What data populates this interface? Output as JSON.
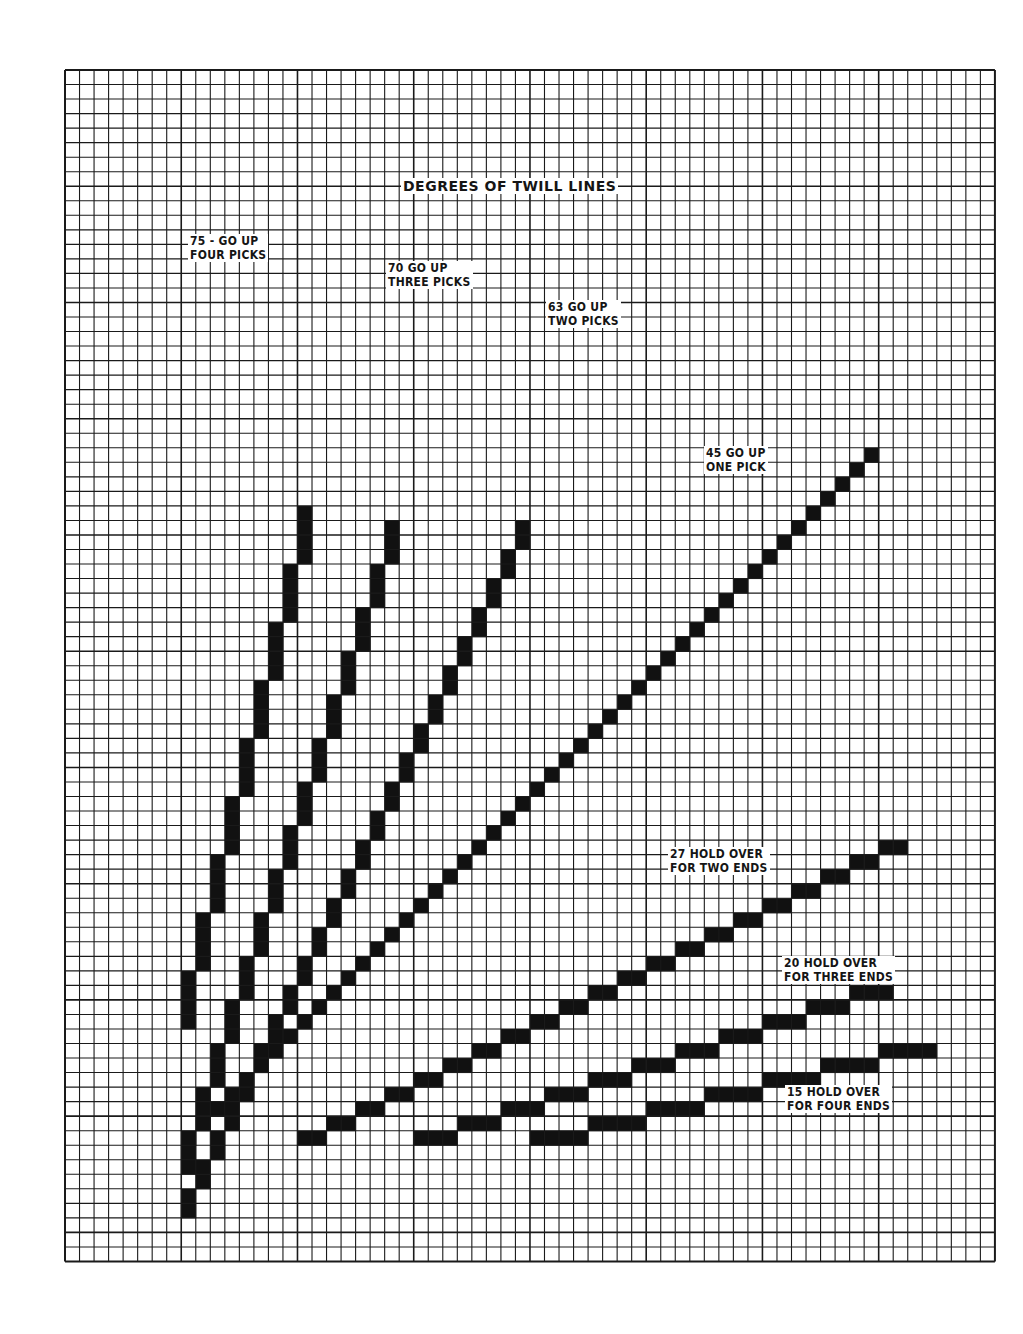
{
  "title": "DEGREES OF TWILL LINES",
  "grid": {
    "left": 65,
    "top": 70,
    "cell": 14.53,
    "cols": 64,
    "rows": 82,
    "line_color": "#1a1a1a",
    "fill_color": "#111111",
    "paper_color": "#ffffff"
  },
  "lines": [
    {
      "id": "75",
      "degrees": "75°",
      "label_line1": "75 - GO UP",
      "label_line2": "FOUR PICKS",
      "rule": "go up four picks",
      "start_col": 8,
      "start_row": 65,
      "step_cols": 1,
      "step_rows": -4,
      "steps": 9,
      "thickness": 1,
      "label_x": 188,
      "label_y": 234
    },
    {
      "id": "70",
      "degrees": "70°",
      "label_line1": "70 GO UP",
      "label_line2": "THREE PICKS",
      "rule": "go up three picks",
      "start_col": 8,
      "start_row": 75,
      "step_cols": 1,
      "step_rows": -3,
      "steps": 15,
      "thickness": 1,
      "label_x": 386,
      "label_y": 261
    },
    {
      "id": "63",
      "degrees": "63°",
      "label_line1": "63 GO UP",
      "label_line2": "TWO PICKS",
      "rule": "go up two picks",
      "start_col": 8,
      "start_row": 78,
      "step_cols": 1,
      "step_rows": -2,
      "steps": 24,
      "thickness": 1,
      "label_x": 546,
      "label_y": 300
    },
    {
      "id": "45",
      "degrees": "45°",
      "label_line1": "45 GO UP",
      "label_line2": "ONE PICK",
      "rule": "go up one pick",
      "start_col": 8,
      "start_row": 73,
      "step_cols": 1,
      "step_rows": -1,
      "steps": 48,
      "thickness": 1,
      "label_x": 704,
      "label_y": 446
    },
    {
      "id": "27",
      "degrees": "27°",
      "label_line1": "27 HOLD OVER",
      "label_line2": "FOR TWO ENDS",
      "rule": "hold over for two ends",
      "start_col": 16,
      "start_row": 73,
      "step_cols": 2,
      "step_rows": -1,
      "steps": 21,
      "thickness": 1,
      "label_x": 668,
      "label_y": 847
    },
    {
      "id": "20",
      "degrees": "20°",
      "label_line1": "20 HOLD OVER",
      "label_line2": "FOR THREE ENDS",
      "rule": "hold over for three ends",
      "start_col": 24,
      "start_row": 73,
      "step_cols": 3,
      "step_rows": -1,
      "steps": 11,
      "thickness": 1,
      "label_x": 782,
      "label_y": 956
    },
    {
      "id": "15",
      "degrees": "15°",
      "label_line1": "15 HOLD OVER",
      "label_line2": "FOR FOUR ENDS",
      "rule": "hold over for four ends",
      "start_col": 32,
      "start_row": 73,
      "step_cols": 4,
      "step_rows": -1,
      "steps": 7,
      "thickness": 1,
      "label_x": 785,
      "label_y": 1085
    }
  ],
  "title_pos": {
    "x": 401,
    "y": 178
  }
}
